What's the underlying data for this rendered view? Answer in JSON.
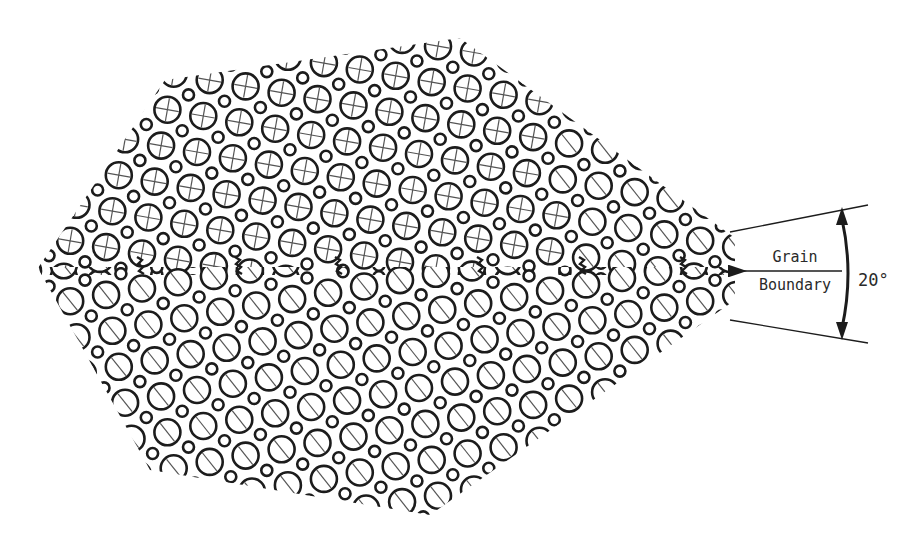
{
  "figure": {
    "width": 918,
    "height": 544,
    "background": "#ffffff",
    "ink_color": "#1c1c1c",
    "hairline_color": "#555555"
  },
  "lattice": {
    "outline_polygon": [
      [
        38,
        268
      ],
      [
        165,
        80
      ],
      [
        460,
        38
      ],
      [
        735,
        238
      ],
      [
        735,
        300
      ],
      [
        430,
        515
      ],
      [
        150,
        470
      ]
    ],
    "boundary": {
      "left_x": 38,
      "right_x": 735,
      "y": 271
    },
    "upper_grain": {
      "rotation_deg": 10,
      "spacing": 36.5,
      "large_r": 13,
      "small_r": 5.5,
      "stroke": 2.6,
      "marking": "cross"
    },
    "lower_grain": {
      "rotation_deg": -10,
      "spacing": 36.5,
      "large_r": 13,
      "small_r": 5.5,
      "stroke": 2.6,
      "marking": "slash"
    },
    "dislocation_markers_x": [
      140,
      238,
      338,
      480,
      582,
      683
    ]
  },
  "annotation": {
    "label_line1": "Grain",
    "label_line2": "Boundary",
    "angle_label": "20°",
    "arrow": {
      "x1": 842,
      "y1": 271,
      "x2": 744,
      "y2": 271
    },
    "upper_line": {
      "x1": 730,
      "y1": 232,
      "x2": 868,
      "y2": 205
    },
    "lower_line": {
      "x1": 730,
      "y1": 320,
      "x2": 868,
      "y2": 343
    },
    "arc": {
      "cx": 650,
      "cy": 274,
      "top_y": 207,
      "bottom_y": 340,
      "x": 842
    }
  }
}
